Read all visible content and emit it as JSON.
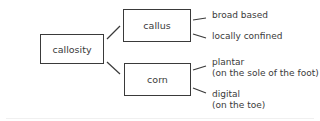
{
  "diagram": {
    "root": {
      "label": "callosity"
    },
    "branches": [
      {
        "label": "callus",
        "children": [
          {
            "label": "broad based"
          },
          {
            "label": "locally confined"
          }
        ]
      },
      {
        "label": "corn",
        "children": [
          {
            "label": "plantar",
            "detail": "(on the sole of the foot)"
          },
          {
            "label": "digital",
            "detail": "(on the toe)"
          }
        ]
      }
    ],
    "colors": {
      "stroke": "#3a3a3a",
      "text": "#3a3a3a",
      "background": "#ffffff"
    }
  }
}
